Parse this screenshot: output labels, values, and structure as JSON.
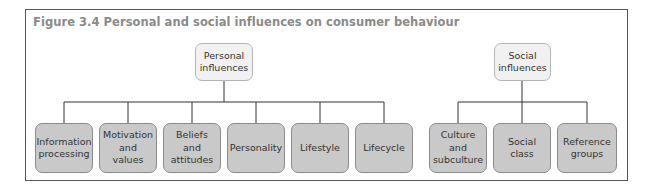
{
  "figure": {
    "title": "Figure 3.4  Personal and social influences on consumer behaviour"
  },
  "colors": {
    "parent_fill": "#f1f1f1",
    "child_fill": "#c9c9c9",
    "line": "#333333",
    "title_text": "#8a8a8a"
  },
  "groups": [
    {
      "id": "personal",
      "label": "Personal\ninfluences",
      "children": [
        {
          "label": "Information\nprocessing"
        },
        {
          "label": "Motivation\nand\nvalues"
        },
        {
          "label": "Beliefs\nand\nattitudes"
        },
        {
          "label": "Personality"
        },
        {
          "label": "Lifestyle"
        },
        {
          "label": "Lifecycle"
        }
      ]
    },
    {
      "id": "social",
      "label": "Social\ninfluences",
      "children": [
        {
          "label": "Culture\nand\nsubculture"
        },
        {
          "label": "Social\nclass"
        },
        {
          "label": "Reference\ngroups"
        }
      ]
    }
  ]
}
